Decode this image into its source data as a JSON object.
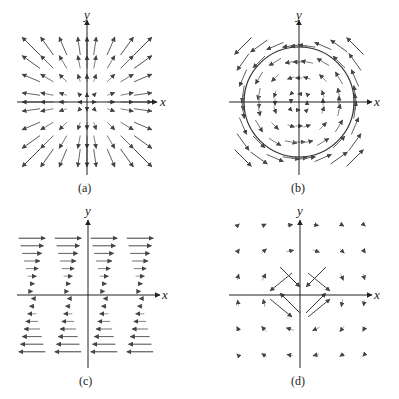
{
  "figure": {
    "panels": [
      {
        "id": "a",
        "caption": "(a)",
        "xlabel": "x",
        "ylabel": "y",
        "field": "radial-outward",
        "origin": [
          87,
          102
        ]
      },
      {
        "id": "b",
        "caption": "(b)",
        "xlabel": "x",
        "ylabel": "y",
        "field": "rotational-counterclockwise",
        "origin": [
          299,
          102
        ],
        "circle_radius": 55
      },
      {
        "id": "c",
        "caption": "(c)",
        "xlabel": "x",
        "ylabel": "y",
        "field": "shear-horizontal",
        "origin": [
          88,
          295
        ]
      },
      {
        "id": "d",
        "caption": "(d)",
        "xlabel": "x",
        "ylabel": "y",
        "field": "saddle-like",
        "origin": [
          300,
          295
        ]
      }
    ],
    "colors": {
      "axis": "#333333",
      "arrow_dark": "#555555",
      "arrow_light": "#aaaaaa"
    }
  }
}
